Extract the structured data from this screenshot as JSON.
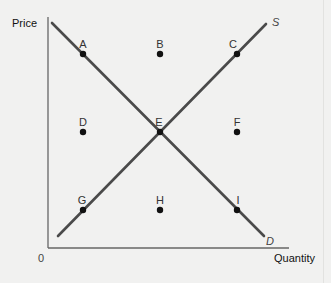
{
  "diagram": {
    "type": "supply-demand",
    "y_axis_label": "Price",
    "x_axis_label": "Quantity",
    "origin_label": "0",
    "curves": [
      {
        "name": "demand",
        "label": "D",
        "color": "#4a4a4a"
      },
      {
        "name": "supply",
        "label": "S",
        "color": "#4a4a4a"
      }
    ],
    "points": [
      {
        "label": "A",
        "row": "high",
        "col": "left",
        "on_curve": "demand"
      },
      {
        "label": "B",
        "row": "high",
        "col": "center",
        "on_curve": null
      },
      {
        "label": "C",
        "row": "high",
        "col": "right",
        "on_curve": "supply"
      },
      {
        "label": "D",
        "row": "middle",
        "col": "left",
        "on_curve": null
      },
      {
        "label": "E",
        "row": "middle",
        "col": "center",
        "on_curve": "both (equilibrium)"
      },
      {
        "label": "F",
        "row": "middle",
        "col": "right",
        "on_curve": null
      },
      {
        "label": "G",
        "row": "low",
        "col": "left",
        "on_curve": "supply"
      },
      {
        "label": "H",
        "row": "low",
        "col": "center",
        "on_curve": null
      },
      {
        "label": "I",
        "row": "low",
        "col": "right",
        "on_curve": "demand"
      }
    ]
  },
  "labels": {
    "price": "Price",
    "quantity": "Quantity",
    "origin": "0",
    "S": "S",
    "D": "D",
    "A": "A",
    "B": "B",
    "C": "C",
    "pD": "D",
    "E": "E",
    "F": "F",
    "G": "G",
    "H": "H",
    "I": "I"
  }
}
